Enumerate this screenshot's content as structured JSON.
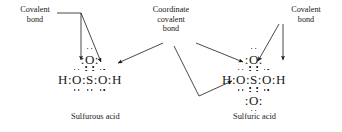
{
  "diagram": {
    "background_color": "#ffffff",
    "ink_color": "#1a1a1a"
  },
  "callouts": {
    "left": {
      "line1": "Covalent",
      "line2": "bond"
    },
    "middle": {
      "line1": "Coordinate",
      "line2": "covalent",
      "line3": "bond"
    },
    "right": {
      "line1": "Covalent",
      "line2": "bond"
    }
  },
  "structures": [
    {
      "name": "sulfurous-acid",
      "caption": "Sulfurous acid",
      "top_oxygen": "O",
      "bottom_oxygen": null,
      "chain": [
        "H",
        ":",
        "O",
        ":",
        "S",
        ":",
        "O",
        ":",
        "H"
      ],
      "central_atom": "S"
    },
    {
      "name": "sulfuric-acid",
      "caption": "Sulfuric acid",
      "top_oxygen": "O",
      "bottom_oxygen": "O",
      "chain": [
        "H",
        ":",
        "O",
        ":",
        "S",
        ":",
        "O",
        ":",
        "H"
      ],
      "central_atom": "S"
    }
  ],
  "captions": {
    "left": "Sulfurous acid",
    "right": "Sulfuric acid"
  },
  "leaders": {
    "left_covalent": "two arrows pointing to H-O and O-S bonds of sulfurous acid",
    "coordinate_left": "arrow pointing to S-O coordinate bond of sulfurous acid",
    "coordinate_right": "two arrows pointing to S-O coordinate bonds of sulfuric acid",
    "right_covalent": "two arrows pointing to O-S and O-H bonds of sulfuric acid"
  }
}
